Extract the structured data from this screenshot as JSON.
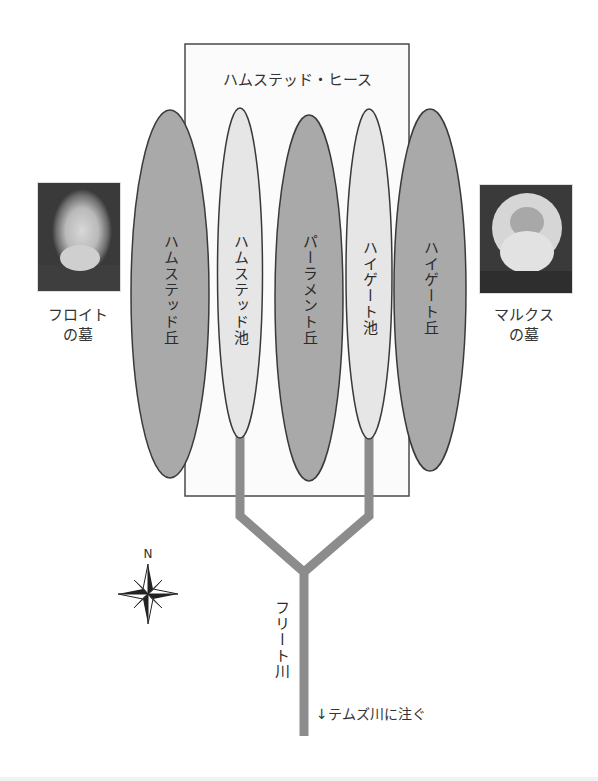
{
  "title": "ハムステッド・ヒース",
  "areas": [
    {
      "id": "hampstead-hill",
      "label": "ハムステッド丘",
      "type": "hill"
    },
    {
      "id": "hampstead-pond",
      "label": "ハムステッド池",
      "type": "pond"
    },
    {
      "id": "parliament-hill",
      "label": "パーラメント丘",
      "type": "hill"
    },
    {
      "id": "highgate-pond",
      "label": "ハイゲート池",
      "type": "pond"
    },
    {
      "id": "highgate-hill",
      "label": "ハイゲート丘",
      "type": "hill"
    }
  ],
  "landmarks": {
    "freud": {
      "line1": "フロイト",
      "line2": "の墓",
      "portrait": "portrait-freud"
    },
    "marx": {
      "line1": "マルクス",
      "line2": "の墓",
      "portrait": "portrait-marx"
    }
  },
  "river": {
    "name": "フリート川",
    "outflow_note": "↓テムズ川に注ぐ"
  },
  "compass": {
    "north_label": "N"
  },
  "colors": {
    "hill_fill": "#a9a9a9",
    "pond_fill": "#e6e6e6",
    "river": "#8c8c8c",
    "outline": "#3a3a3a",
    "heath_fill": "#fbfbfb"
  }
}
